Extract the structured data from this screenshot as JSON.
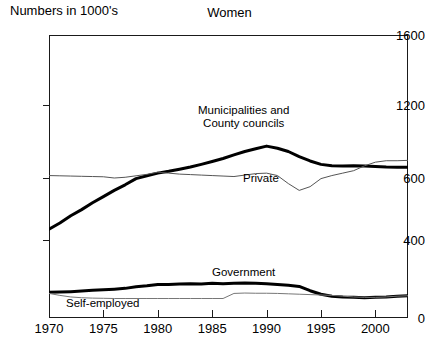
{
  "chart_data": {
    "type": "line",
    "title": "Women",
    "ylabel": "Numbers in 1000's",
    "xlabel": "",
    "grid": false,
    "legend_position": "inline-annotations",
    "xlim": [
      1970,
      2003
    ],
    "ylim": [
      0,
      1600
    ],
    "yticks": [
      0,
      400,
      600,
      1200,
      1600
    ],
    "ytick_labels": [
      "0",
      "400",
      "600",
      "1200",
      "1600"
    ],
    "xticks": [
      1970,
      1975,
      1980,
      1985,
      1990,
      1995,
      2000
    ],
    "xtick_labels": [
      "1970",
      "1975",
      "1980",
      "1985",
      "1990",
      "1995",
      "2000"
    ],
    "x": [
      1970,
      1971,
      1972,
      1973,
      1974,
      1975,
      1976,
      1977,
      1978,
      1979,
      1980,
      1981,
      1982,
      1983,
      1984,
      1985,
      1986,
      1987,
      1988,
      1989,
      1990,
      1991,
      1992,
      1993,
      1994,
      1995,
      1996,
      1997,
      1998,
      1999,
      2000,
      2001,
      2002,
      2003
    ],
    "series": [
      {
        "name": "Municipalities and County councils",
        "style": "thick-black",
        "color": "#000000",
        "values": [
          435,
          455,
          478,
          498,
          520,
          540,
          560,
          578,
          598,
          618,
          640,
          655,
          672,
          690,
          712,
          735,
          760,
          790,
          818,
          840,
          862,
          845,
          818,
          775,
          740,
          712,
          700,
          698,
          700,
          698,
          694,
          690,
          688,
          688
        ]
      },
      {
        "name": "Private",
        "style": "thin-gray",
        "color": "#555555",
        "values": [
          620,
          618,
          616,
          614,
          612,
          610,
          600,
          606,
          618,
          630,
          648,
          640,
          632,
          628,
          624,
          620,
          616,
          612,
          624,
          636,
          640,
          620,
          582,
          560,
          572,
          598,
          620,
          640,
          660,
          700,
          730,
          742,
          742,
          745
        ]
      },
      {
        "name": "Government",
        "style": "thick-black",
        "color": "#000000",
        "values": [
          132,
          133,
          135,
          138,
          142,
          145,
          148,
          152,
          160,
          165,
          172,
          172,
          174,
          176,
          174,
          178,
          176,
          178,
          180,
          178,
          176,
          172,
          168,
          162,
          140,
          122,
          112,
          108,
          106,
          104,
          106,
          108,
          112,
          114
        ]
      },
      {
        "name": "Self-employed",
        "style": "thin-gray",
        "color": "#777777",
        "values": [
          126,
          116,
          108,
          104,
          102,
          101,
          100,
          100,
          100,
          100,
          100,
          100,
          100,
          100,
          100,
          100,
          100,
          126,
          128,
          127,
          127,
          126,
          124,
          122,
          120,
          118,
          116,
          112,
          108,
          106,
          106,
          108,
          112,
          114
        ]
      }
    ],
    "annotations": [
      {
        "id": "municipalities",
        "text_line1": "Municipalities and",
        "text_line2": "County councils"
      },
      {
        "id": "private",
        "text": "Private"
      },
      {
        "id": "government",
        "text": "Government"
      },
      {
        "id": "selfemployed",
        "text": "Self-employed"
      }
    ]
  }
}
